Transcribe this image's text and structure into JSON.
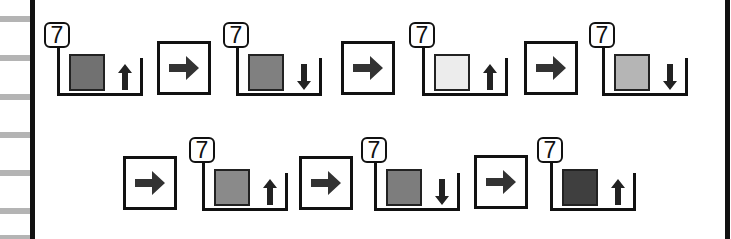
{
  "left_margin": {
    "stripe_color": "#b4b4b4",
    "stripe_y": [
      16,
      55,
      94,
      132,
      170,
      208,
      235
    ]
  },
  "sequence": {
    "rows": [
      {
        "steps": [
          {
            "badge": "7",
            "swatch_color": "#717171",
            "direction": "up"
          },
          {
            "badge": "7",
            "swatch_color": "#808080",
            "direction": "down"
          },
          {
            "badge": "7",
            "swatch_color": "#ececec",
            "direction": "up"
          },
          {
            "badge": "7",
            "swatch_color": "#b5b5b5",
            "direction": "down"
          }
        ],
        "connectors": [
          "arrow-right",
          "arrow-right",
          "arrow-right"
        ]
      },
      {
        "steps": [
          {
            "badge": "7",
            "swatch_color": "#8a8a8a",
            "direction": "up"
          },
          {
            "badge": "7",
            "swatch_color": "#7d7d7d",
            "direction": "down"
          },
          {
            "badge": "7",
            "swatch_color": "#3f3f3f",
            "direction": "up"
          }
        ],
        "connectors": [
          "arrow-right",
          "arrow-right",
          "arrow-right"
        ]
      }
    ]
  }
}
